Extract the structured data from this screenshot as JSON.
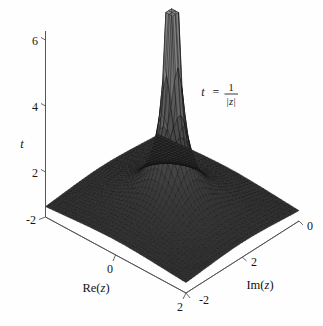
{
  "figure": {
    "kind": "surface-plot-3d",
    "background_color": "#fefefe",
    "annotation": {
      "lhs": "t",
      "equals": "=",
      "numerator": "1",
      "denominator": "|z|",
      "full": "t = 1/|z|"
    }
  },
  "axes": {
    "vertical": {
      "label": "t",
      "ticks": [
        "2",
        "4",
        "6"
      ],
      "tick_values": [
        2,
        4,
        6
      ],
      "range": [
        0,
        7
      ]
    },
    "re": {
      "label": "Re(z)",
      "label_prefix": "Re(",
      "label_var": "z",
      "label_suffix": ")",
      "ticks": [
        "-2",
        "0",
        "2"
      ],
      "tick_values": [
        -2,
        0,
        2
      ],
      "range": [
        -2,
        2
      ]
    },
    "im": {
      "label": "Im(z)",
      "label_prefix": "Im(",
      "label_var": "z",
      "label_suffix": ")",
      "ticks": [
        "-2",
        "0",
        "2"
      ],
      "tick_values": [
        -2,
        2,
        0
      ],
      "range": [
        -2,
        2
      ]
    }
  },
  "chart_data": {
    "type": "surface",
    "title": "",
    "subtitle": "",
    "xlabel": "Re(z)",
    "ylabel": "Im(z)",
    "zlabel": "t",
    "annotations": [
      "t = 1/|z|"
    ],
    "function": "t = 1/|z| = 1/sqrt(Re(z)^2 + Im(z)^2)",
    "xlim": [
      -2,
      2
    ],
    "ylim": [
      -2,
      2
    ],
    "zlim": [
      0,
      7
    ],
    "zclip": 7,
    "xticks": [
      -2,
      0,
      2
    ],
    "yticks": [
      -2,
      0,
      2
    ],
    "zticks": [
      2,
      4,
      6
    ],
    "grid": true,
    "legend": "none",
    "mesh_n": 41,
    "surface_color": "#3a3a3a",
    "mesh_line_color": "#111111",
    "peak_value": 7,
    "peak_location": [
      0,
      0
    ]
  },
  "colors": {
    "axis": "#555555",
    "text": "#161616",
    "surface_dark": "#2f2f2f",
    "surface_mid": "#4a4a4a",
    "surface_light": "#8e8e8e",
    "background": "#fefefe"
  }
}
